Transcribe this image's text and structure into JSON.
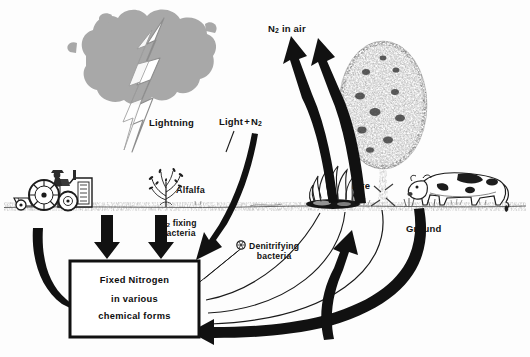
{
  "diagram": {
    "background_color": "#fdfdfd",
    "ink_color": "#111111",
    "cloud_color": "#a8a8a8",
    "ground_color": "#9a9a9a"
  },
  "labels": {
    "n2_in_air": "N2 in air",
    "n2_in_air_parts": {
      "base": "N",
      "sub": "2",
      "rest": " in air"
    },
    "light_n2_parts": {
      "word": "Light",
      "plus": "+",
      "base": "N",
      "sub": "2"
    },
    "lightning": "Lightning",
    "alfalfa": "Alfalfa",
    "n2_fixing_parts": {
      "base": "N",
      "sub": "2",
      "rest": " fixing"
    },
    "n2_fixing_line2": "bacteria",
    "denitrifying_line1": "Denitrifying",
    "denitrifying_line2": "bacteria",
    "fire": "Fire",
    "ground": "Ground"
  },
  "fixed_nitrogen_box": {
    "line1": "Fixed  Nitrogen",
    "line2": "in  various",
    "line3": "chemical  forms"
  },
  "scene_objects": [
    {
      "name": "storm-cloud",
      "label": ""
    },
    {
      "name": "lightning-bolt",
      "label": "Lightning"
    },
    {
      "name": "tractor",
      "label": ""
    },
    {
      "name": "alfalfa-plant",
      "label": "Alfalfa"
    },
    {
      "name": "campfire",
      "label": "Fire"
    },
    {
      "name": "tree",
      "label": ""
    },
    {
      "name": "cow",
      "label": ""
    },
    {
      "name": "bacteria-symbol",
      "label": "Denitrifying bacteria"
    }
  ],
  "flow_arrows": [
    {
      "name": "arrow-fire-to-air",
      "from": "Fire",
      "to": "N2 in air"
    },
    {
      "name": "arrow-tree-to-air",
      "from": "Ground",
      "to": "N2 in air"
    },
    {
      "name": "arrow-light-to-box",
      "from": "Light + N2",
      "to": "Fixed Nitrogen"
    },
    {
      "name": "arrow-tractor-to-box",
      "from": "tractor",
      "to": "Fixed Nitrogen"
    },
    {
      "name": "arrow-alfalfa-to-box",
      "from": "N2 fixing bacteria",
      "to": "Fixed Nitrogen"
    },
    {
      "name": "arrow-lightning-to-box",
      "from": "Lightning",
      "to": "Fixed Nitrogen"
    },
    {
      "name": "arrow-box-to-denitrifying",
      "from": "Fixed Nitrogen",
      "to": "Denitrifying bacteria"
    },
    {
      "name": "arrow-ground-return-to-box",
      "from": "Ground",
      "to": "Fixed Nitrogen"
    }
  ]
}
